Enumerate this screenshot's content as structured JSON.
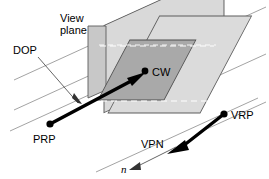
{
  "figure": {
    "type": "line-diagram",
    "background": "#ffffff",
    "colors": {
      "view_plane_fill": "#d9d9d9",
      "window_fill": "#a8a8a8",
      "flap_fill": "#c9c9c9",
      "outline": "#4d4d4d",
      "grid_line": "#8c8c8c",
      "arrow": "#000000",
      "leader": "#555555",
      "text": "#000000"
    },
    "labels": [
      {
        "id": "view-plane",
        "text_line1": "View",
        "text_line2": "plane",
        "x": 60,
        "y": 14
      },
      {
        "id": "dop",
        "text": "DOP",
        "x": 13,
        "y": 50
      },
      {
        "id": "prp",
        "text": "PRP",
        "x": 33,
        "y": 143
      },
      {
        "id": "cw",
        "text": "CW",
        "x": 152,
        "y": 76
      },
      {
        "id": "vrp",
        "text": "VRP",
        "x": 231,
        "y": 120
      },
      {
        "id": "vpn",
        "text": "VPN",
        "x": 141,
        "y": 147
      },
      {
        "id": "n",
        "text": "n",
        "x": 123,
        "y": 172
      }
    ],
    "points": [
      {
        "id": "prp-point",
        "x": 50,
        "y": 124
      },
      {
        "id": "cw-point",
        "x": 145,
        "y": 71
      },
      {
        "id": "vrp-point",
        "x": 224,
        "y": 114
      }
    ],
    "arrows": [
      {
        "id": "dop-arrow",
        "from": "PRP",
        "to": "CW",
        "style": "thick"
      },
      {
        "id": "vpn-arrow",
        "from": "VRP",
        "to": "VPN direction",
        "style": "thick"
      },
      {
        "id": "n-arrow",
        "from": "VPN",
        "to": "n",
        "style": "thin"
      },
      {
        "id": "dop-leader",
        "from": "DOP label",
        "to": "DOP line",
        "style": "leader"
      }
    ],
    "grid_lines_count": 6
  }
}
